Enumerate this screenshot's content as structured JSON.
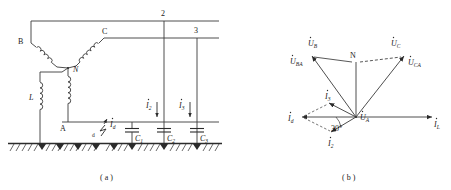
{
  "figure": {
    "caption_a": "( a )",
    "caption_b": "( b )"
  },
  "circuit": {
    "nodes": {
      "phase_b": "B",
      "phase_c": "C",
      "phase_a": "A",
      "neutral": "N"
    },
    "lines": {
      "line2": "2",
      "line3": "3"
    },
    "components": {
      "inductor": "L",
      "cap1": "C",
      "cap1_sub": "1",
      "cap2": "C",
      "cap2_sub": "2",
      "cap3": "C",
      "cap3_sub": "3"
    },
    "fault": {
      "point": "d",
      "current": "I",
      "current_sub": "d"
    },
    "currents": {
      "i2": "I",
      "i2_sub": "2",
      "i3": "I",
      "i3_sub": "3"
    }
  },
  "phasor": {
    "neutral": "N",
    "voltages": {
      "ub": "U",
      "ub_sub": "B",
      "uc": "U",
      "uc_sub": "C",
      "ua": "U",
      "ua_sub": "A",
      "uba": "U",
      "uba_sub": "BA",
      "uca": "U",
      "uca_sub": "CA"
    },
    "currents": {
      "id": "I",
      "id_sub": "d",
      "i2": "I",
      "i2_sub": "2",
      "i3": "I",
      "i3_sub": "3",
      "il": "I",
      "il_sub": "L"
    },
    "angle": "30°"
  },
  "colors": {
    "line": "#3a3a3a",
    "ground": "#2b2b2b",
    "background": "#ffffff"
  }
}
